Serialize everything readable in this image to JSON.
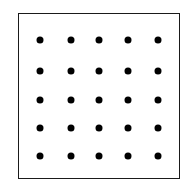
{
  "diagram": {
    "type": "dot-grid",
    "rows": 5,
    "columns": 5,
    "dot_count": 25,
    "frame": {
      "left": 18,
      "top": 13,
      "right": 180,
      "bottom": 179
    },
    "column_centers": [
      40,
      71,
      99,
      128,
      158
    ],
    "row_centers": [
      40,
      71,
      100,
      128,
      156
    ],
    "dot_diameter": 7,
    "colors": {
      "dot": "#000000",
      "border": "#1a1a1a",
      "background": "#ffffff"
    }
  }
}
